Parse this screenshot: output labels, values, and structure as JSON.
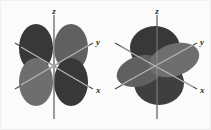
{
  "figure": {
    "title": "",
    "background_color": "#fbfbfb",
    "border_color": "#f0f0f0",
    "width": 211,
    "height": 130
  },
  "palette": {
    "axis_line": "#4a4a4a",
    "axis_line_light": "#b9b9b9",
    "label_color": "#2b2b2b",
    "lobe_dark": "#383838",
    "lobe_mid": "#606060",
    "lobe_light": "#6e6e6e",
    "lobe_lighter": "#777777"
  },
  "panels": [
    {
      "id": "left-orbital",
      "name": "d-orbital-four-lobe",
      "axes": {
        "z": {
          "label": "z"
        },
        "y": {
          "label": "y"
        },
        "x": {
          "label": "x"
        }
      },
      "lobes": [
        {
          "name": "lobe-back-left-dark",
          "shade": "dark"
        },
        {
          "name": "lobe-back-right-mid",
          "shade": "mid"
        },
        {
          "name": "lobe-front-left-light",
          "shade": "light"
        },
        {
          "name": "lobe-front-right-dark",
          "shade": "dark"
        }
      ]
    },
    {
      "id": "right-orbital",
      "name": "d-orbital-lobes-with-disk",
      "axes": {
        "z": {
          "label": "z"
        },
        "y": {
          "label": "y"
        },
        "x": {
          "label": "x"
        }
      },
      "lobes": [
        {
          "name": "lobe-upper-dark",
          "shade": "dark"
        },
        {
          "name": "lobe-lower-dark",
          "shade": "dark"
        },
        {
          "name": "disk-left-mid",
          "shade": "mid"
        },
        {
          "name": "disk-right-light",
          "shade": "light"
        }
      ]
    }
  ]
}
